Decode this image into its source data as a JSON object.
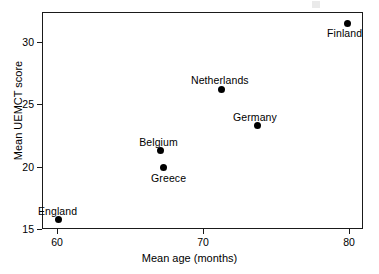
{
  "chart_data": {
    "type": "scatter",
    "title": "",
    "xlabel": "Mean age (months)",
    "ylabel": "Mean UEMCT score",
    "xlim": [
      58.8,
      80.8
    ],
    "ylim": [
      14.05,
      30.9
    ],
    "xticks": [
      60,
      70,
      80
    ],
    "xticklabels": [
      "60",
      "70",
      "80"
    ],
    "yticks": [
      15,
      20,
      25,
      30
    ],
    "yticklabels": [
      "15",
      "20",
      "25",
      "30"
    ],
    "grid": false,
    "legend": false,
    "marker": "filled-circle",
    "marker_color": "#000000",
    "points": [
      {
        "label": "England",
        "x": 60.1,
        "y": 15.8,
        "label_dx": -1,
        "label_dy": -13
      },
      {
        "label": "Belgium",
        "x": 67.1,
        "y": 21.3,
        "label_dx": -2,
        "label_dy": -13
      },
      {
        "label": "Greece",
        "x": 67.3,
        "y": 19.9,
        "label_dx": 5,
        "label_dy": 5
      },
      {
        "label": "Netherlands",
        "x": 71.3,
        "y": 26.2,
        "label_dx": -2,
        "label_dy": -14
      },
      {
        "label": "Germany",
        "x": 73.7,
        "y": 23.3,
        "label_dx": -2,
        "label_dy": -14
      },
      {
        "label": "Finland",
        "x": 79.9,
        "y": 31.5,
        "label_dx": -3,
        "label_dy": 5
      }
    ]
  }
}
